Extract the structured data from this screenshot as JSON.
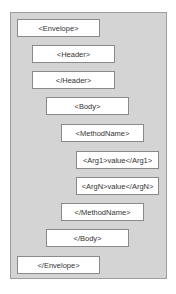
{
  "diagram": {
    "elements": [
      {
        "label": "<Envelope>",
        "level": 0
      },
      {
        "label": "<Header>",
        "level": 1
      },
      {
        "label": "</Header>",
        "level": 1
      },
      {
        "label": "<Body>",
        "level": 2
      },
      {
        "label": "<MethodName>",
        "level": 3
      },
      {
        "label": "<Arg1>value</Arg1>",
        "level": 4
      },
      {
        "label": "<ArgN>value</ArgN>",
        "level": 4
      },
      {
        "label": "</MethodName>",
        "level": 3
      },
      {
        "label": "</Body>",
        "level": 2
      },
      {
        "label": "</Envelope>",
        "level": 0
      }
    ]
  },
  "colors": {
    "panel": "#d4d4d4",
    "box": "#ffffff",
    "border": "#8a8a8a",
    "text": "#333333"
  }
}
